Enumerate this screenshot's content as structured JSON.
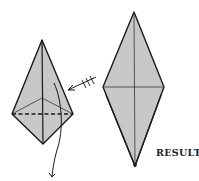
{
  "diagram": {
    "type": "origami-fold-step",
    "colors": {
      "paper_fill": "#c8c8c8",
      "stroke": "#1a1a1a",
      "background": "#ffffff"
    },
    "step_figure": {
      "shape": "kite",
      "top": [
        42,
        40
      ],
      "left": [
        12,
        114
      ],
      "right": [
        73,
        114
      ],
      "bottom": [
        43,
        144
      ],
      "inner_point": [
        42,
        98
      ],
      "fold_line": "dashed horizontal",
      "arrow": "curved arrow folding flap down",
      "push_arrow": "arrow with three ticks pointing to right edge"
    },
    "result_figure": {
      "shape": "elongated diamond",
      "top": [
        134,
        12
      ],
      "left": [
        103,
        87
      ],
      "right": [
        164,
        87
      ],
      "bottom": [
        135,
        166
      ]
    },
    "labels": {
      "result": "RESULT"
    }
  }
}
